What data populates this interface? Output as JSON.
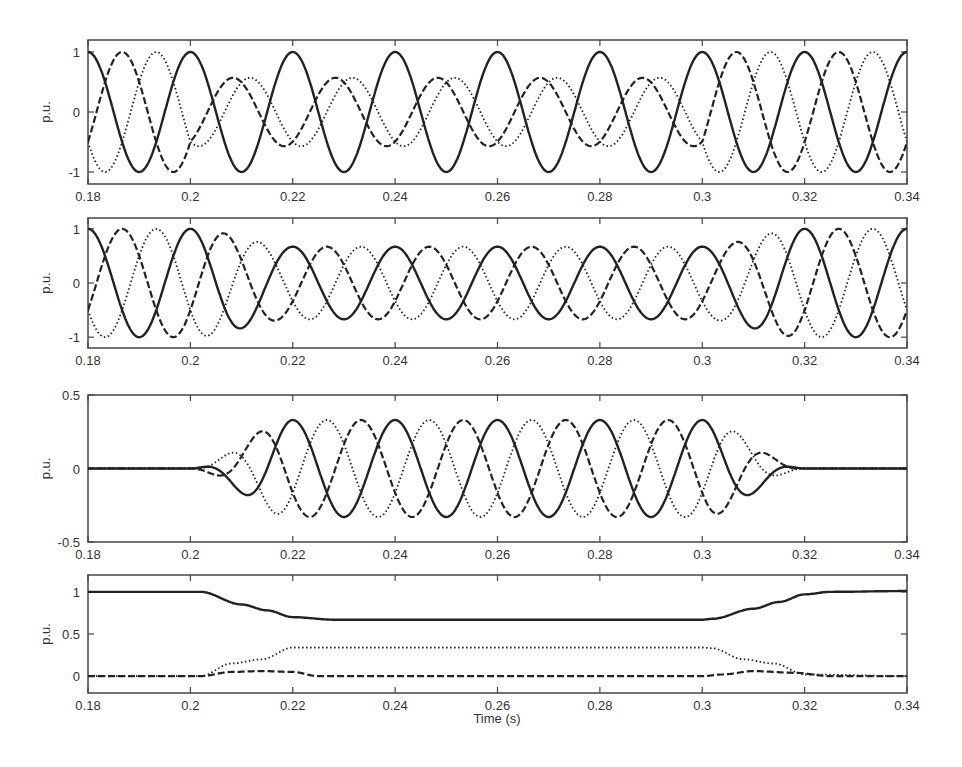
{
  "figure": {
    "xlabel": "Time (s)",
    "ylabel": "p.u.",
    "x_ticks": [
      "0.18",
      "0.2",
      "0.22",
      "0.24",
      "0.26",
      "0.28",
      "0.3",
      "0.32",
      "0.34"
    ],
    "line_color": "#222222"
  },
  "chart_data": [
    {
      "type": "line",
      "title": "",
      "xlabel": "",
      "ylabel": "p.u.",
      "xlim": [
        0.18,
        0.34
      ],
      "ylim": [
        -1.2,
        1.2
      ],
      "y_ticks": [
        "-1",
        "0",
        "1"
      ],
      "grid": false,
      "description": "Three-phase sinusoidal voltages (50 Hz); amplitude 1 before 0.2 s, phase-shifted/unbalanced during 0.2-0.3 s (two phases ~0.57 amplitude, one ~1), restored to 1 after 0.3 s",
      "series": [
        {
          "name": "Phase A",
          "style": "solid",
          "segments": [
            {
              "x": [
                0.18,
                0.34
              ],
              "amplitude": 1.0,
              "phase_deg": 0
            }
          ]
        },
        {
          "name": "Phase B",
          "style": "dashed",
          "segments": [
            {
              "x": [
                0.18,
                0.2
              ],
              "amplitude": 1.0,
              "phase_deg": -120
            },
            {
              "x": [
                0.2,
                0.3
              ],
              "amplitude": 0.57,
              "phase_deg": -150
            },
            {
              "x": [
                0.3,
                0.34
              ],
              "amplitude": 1.0,
              "phase_deg": -120
            }
          ]
        },
        {
          "name": "Phase C",
          "style": "dotted",
          "segments": [
            {
              "x": [
                0.18,
                0.2
              ],
              "amplitude": 1.0,
              "phase_deg": 120
            },
            {
              "x": [
                0.2,
                0.3
              ],
              "amplitude": 0.57,
              "phase_deg": 150
            },
            {
              "x": [
                0.3,
                0.34
              ],
              "amplitude": 1.0,
              "phase_deg": 120
            }
          ]
        }
      ]
    },
    {
      "type": "line",
      "title": "",
      "xlabel": "",
      "ylabel": "p.u.",
      "xlim": [
        0.18,
        0.34
      ],
      "ylim": [
        -1.2,
        1.2
      ],
      "y_ticks": [
        "-1",
        "0",
        "1"
      ],
      "grid": false,
      "description": "Three-phase balanced voltages; amplitude 1.0, dips smoothly to ~0.67 between 0.2 and 0.22 s, holds until 0.3 s, recovers to 1.0 by ~0.32 s",
      "series": [
        {
          "name": "Phase A",
          "style": "solid",
          "phase_deg": 0
        },
        {
          "name": "Phase B",
          "style": "dashed",
          "phase_deg": -120
        },
        {
          "name": "Phase C",
          "style": "dotted",
          "phase_deg": 120
        }
      ],
      "envelope": {
        "x": [
          0.18,
          0.2,
          0.22,
          0.3,
          0.32,
          0.34
        ],
        "amplitude": [
          1.0,
          1.0,
          0.67,
          0.67,
          1.0,
          1.0
        ]
      }
    },
    {
      "type": "line",
      "title": "",
      "xlabel": "",
      "ylabel": "p.u.",
      "xlim": [
        0.18,
        0.34
      ],
      "ylim": [
        -0.5,
        0.5
      ],
      "y_ticks": [
        "-0.5",
        "0",
        "0.5"
      ],
      "grid": false,
      "description": "Negative-sequence three-phase components; zero before 0.2 s, grows to ~0.33 amplitude by 0.22 s, holds, decays to zero by ~0.32 s",
      "series": [
        {
          "name": "Phase A",
          "style": "solid",
          "phase_deg": 0
        },
        {
          "name": "Phase B",
          "style": "dashed",
          "phase_deg": 120
        },
        {
          "name": "Phase C",
          "style": "dotted",
          "phase_deg": -120
        }
      ],
      "envelope": {
        "x": [
          0.18,
          0.2,
          0.22,
          0.3,
          0.32,
          0.34
        ],
        "amplitude": [
          0.0,
          0.0,
          0.33,
          0.33,
          0.0,
          0.0
        ]
      }
    },
    {
      "type": "line",
      "title": "",
      "xlabel": "Time (s)",
      "ylabel": "p.u.",
      "xlim": [
        0.18,
        0.34
      ],
      "ylim": [
        -0.2,
        1.2
      ],
      "y_ticks": [
        "0",
        "0.5",
        "1"
      ],
      "grid": false,
      "series": [
        {
          "name": "Positive sequence magnitude",
          "style": "solid",
          "x": [
            0.18,
            0.202,
            0.21,
            0.215,
            0.22,
            0.228,
            0.3,
            0.302,
            0.31,
            0.315,
            0.32,
            0.325,
            0.34
          ],
          "y": [
            1.0,
            1.0,
            0.85,
            0.78,
            0.7,
            0.67,
            0.67,
            0.68,
            0.8,
            0.88,
            0.97,
            1.0,
            1.01
          ]
        },
        {
          "name": "Negative sequence magnitude",
          "style": "dotted",
          "x": [
            0.18,
            0.202,
            0.208,
            0.214,
            0.22,
            0.3,
            0.302,
            0.308,
            0.314,
            0.32,
            0.34
          ],
          "y": [
            0.0,
            0.0,
            0.15,
            0.2,
            0.34,
            0.34,
            0.33,
            0.2,
            0.15,
            0.02,
            0.0
          ]
        },
        {
          "name": "Zero sequence magnitude",
          "style": "dashed",
          "x": [
            0.18,
            0.202,
            0.208,
            0.214,
            0.22,
            0.225,
            0.3,
            0.304,
            0.31,
            0.318,
            0.325,
            0.34
          ],
          "y": [
            0.0,
            0.0,
            0.05,
            0.06,
            0.05,
            0.0,
            0.0,
            0.02,
            0.06,
            0.04,
            0.0,
            0.0
          ]
        }
      ]
    }
  ]
}
